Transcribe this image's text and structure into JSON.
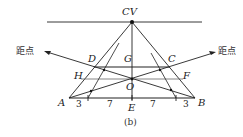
{
  "diagram": {
    "caption": "(b)",
    "vanishing_point_label": "CV",
    "distance_point_left_label": "距点",
    "distance_point_right_label": "距点",
    "point_labels": {
      "A": "A",
      "B": "B",
      "C": "C",
      "D": "D",
      "E": "E",
      "F": "F",
      "G": "G",
      "H": "H",
      "O": "O"
    },
    "base_segment_labels": [
      "3",
      "7",
      "7",
      "3"
    ],
    "colors": {
      "line": "#222222",
      "background": "#ffffff"
    }
  }
}
